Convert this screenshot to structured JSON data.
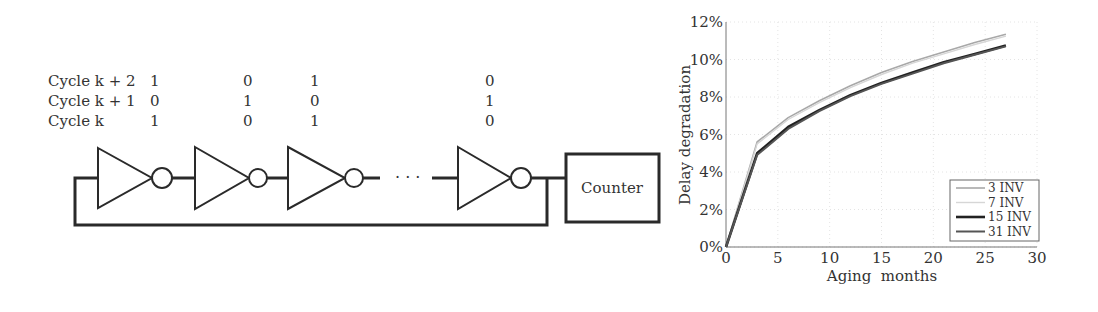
{
  "diagram": {
    "rows": [
      {
        "label": "Cycle k + 2",
        "values": [
          "1",
          "0",
          "1",
          "0"
        ]
      },
      {
        "label": "Cycle k + 1",
        "values": [
          "0",
          "1",
          "0",
          "1"
        ]
      },
      {
        "label": "Cycle k",
        "values": [
          "1",
          "0",
          "1",
          "0"
        ]
      }
    ],
    "ellipsis": "· · ·",
    "counter_label": "Counter"
  },
  "chart_data": {
    "type": "line",
    "title": "",
    "xlabel": "Aging  months",
    "ylabel": "Delay degradation",
    "xlim": [
      0,
      30
    ],
    "ylim": [
      0,
      12
    ],
    "x_ticks": [
      "0",
      "5",
      "10",
      "15",
      "20",
      "25",
      "30"
    ],
    "y_ticks": [
      "0%",
      "2%",
      "4%",
      "6%",
      "8%",
      "10%",
      "12%"
    ],
    "grid": true,
    "legend_position": "lower right",
    "x": [
      0,
      3,
      6,
      9,
      12,
      15,
      18,
      21,
      24,
      27
    ],
    "series": [
      {
        "name": "3 INV",
        "color": "#a8a8a8",
        "values": [
          0,
          5.6,
          6.9,
          7.8,
          8.6,
          9.3,
          9.9,
          10.4,
          10.9,
          11.35
        ]
      },
      {
        "name": "7 INV",
        "color": "#d6d6d6",
        "values": [
          0,
          5.5,
          6.8,
          7.7,
          8.5,
          9.2,
          9.8,
          10.3,
          10.8,
          11.25
        ]
      },
      {
        "name": "15 INV",
        "color": "#222222",
        "values": [
          0,
          5.0,
          6.4,
          7.3,
          8.1,
          8.75,
          9.3,
          9.85,
          10.3,
          10.75
        ]
      },
      {
        "name": "31 INV",
        "color": "#555555",
        "values": [
          0,
          4.9,
          6.3,
          7.25,
          8.05,
          8.7,
          9.25,
          9.8,
          10.25,
          10.7
        ]
      }
    ]
  }
}
